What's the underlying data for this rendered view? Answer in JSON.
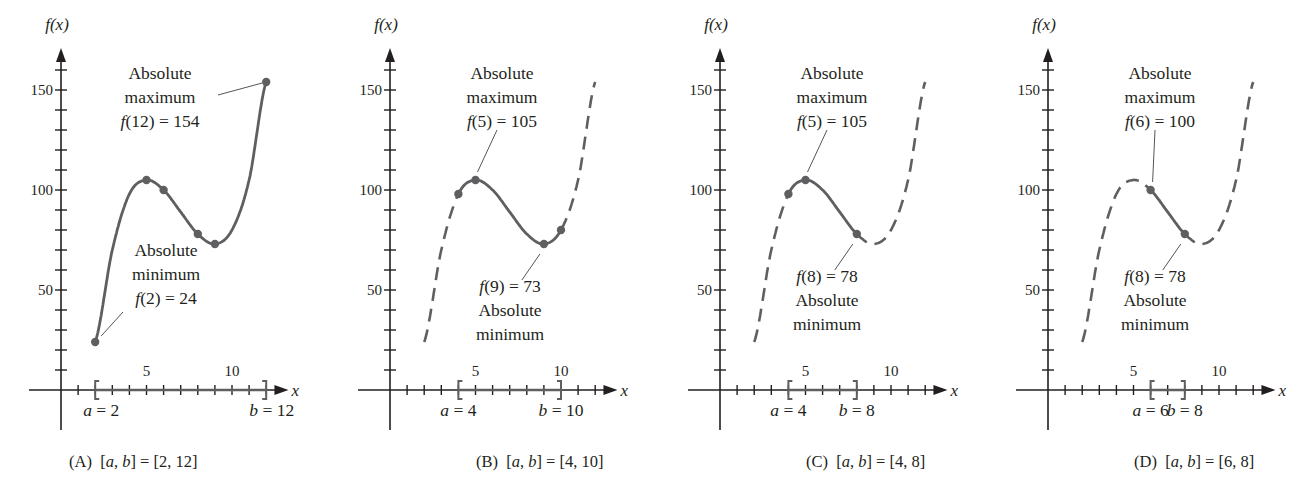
{
  "figure": {
    "colors": {
      "curve": "#5f5f61",
      "axis": "#231f20",
      "text": "#231f20",
      "background": "#ffffff"
    }
  },
  "chart_data": [
    {
      "id": "A",
      "type": "line",
      "caption": "(A)  [a, b] = [2, 12]",
      "ylabel": "f(x)",
      "xlabel": "x",
      "xlim": [
        -1,
        12.7
      ],
      "ylim": [
        -20,
        175
      ],
      "x_tick_labels": [
        {
          "x": 5,
          "label": "5"
        },
        {
          "x": 10,
          "label": "10"
        }
      ],
      "y_tick_labels": [
        {
          "y": 50,
          "label": "50"
        },
        {
          "y": 100,
          "label": "100"
        },
        {
          "y": 150,
          "label": "150"
        }
      ],
      "interval": {
        "a": 2,
        "b": 12,
        "a_label": "a = 2",
        "b_label": "b = 12"
      },
      "solid_range": [
        2,
        12
      ],
      "dashed_ranges": [],
      "points": [
        {
          "x": 2,
          "y": 24
        },
        {
          "x": 5,
          "y": 105
        },
        {
          "x": 6,
          "y": 100
        },
        {
          "x": 8,
          "y": 78
        },
        {
          "x": 9,
          "y": 73
        },
        {
          "x": 12,
          "y": 154
        }
      ],
      "annotations": [
        {
          "lines": [
            "Absolute",
            "maximum",
            "f(12) = 154"
          ],
          "kind": "absolute maximum",
          "x": 12,
          "y": 154
        },
        {
          "lines": [
            "Absolute",
            "minimum",
            "f(2) = 24"
          ],
          "kind": "absolute minimum",
          "x": 2,
          "y": 24
        }
      ]
    },
    {
      "id": "B",
      "type": "line",
      "caption": "(B)  [a, b] = [4, 10]",
      "ylabel": "f(x)",
      "xlabel": "x",
      "xlim": [
        -1,
        12.7
      ],
      "ylim": [
        -20,
        175
      ],
      "x_tick_labels": [
        {
          "x": 5,
          "label": "5"
        },
        {
          "x": 10,
          "label": "10"
        }
      ],
      "y_tick_labels": [
        {
          "y": 50,
          "label": "50"
        },
        {
          "y": 100,
          "label": "100"
        },
        {
          "y": 150,
          "label": "150"
        }
      ],
      "interval": {
        "a": 4,
        "b": 10,
        "a_label": "a = 4",
        "b_label": "b = 10"
      },
      "solid_range": [
        4,
        10
      ],
      "dashed_ranges": [
        [
          2,
          4
        ],
        [
          10,
          12
        ]
      ],
      "points": [
        {
          "x": 4,
          "y": 98
        },
        {
          "x": 5,
          "y": 105
        },
        {
          "x": 9,
          "y": 73
        },
        {
          "x": 10,
          "y": 80
        }
      ],
      "annotations": [
        {
          "lines": [
            "Absolute",
            "maximum",
            "f(5) = 105"
          ],
          "kind": "absolute maximum",
          "x": 5,
          "y": 105
        },
        {
          "lines": [
            "f(9) = 73",
            "Absolute",
            "minimum"
          ],
          "kind": "absolute minimum",
          "x": 9,
          "y": 73
        }
      ]
    },
    {
      "id": "C",
      "type": "line",
      "caption": "(C)  [a, b] = [4, 8]",
      "ylabel": "f(x)",
      "xlabel": "x",
      "xlim": [
        -1,
        12.7
      ],
      "ylim": [
        -20,
        175
      ],
      "x_tick_labels": [
        {
          "x": 5,
          "label": "5"
        },
        {
          "x": 10,
          "label": "10"
        }
      ],
      "y_tick_labels": [
        {
          "y": 50,
          "label": "50"
        },
        {
          "y": 100,
          "label": "100"
        },
        {
          "y": 150,
          "label": "150"
        }
      ],
      "interval": {
        "a": 4,
        "b": 8,
        "a_label": "a = 4",
        "b_label": "b = 8"
      },
      "solid_range": [
        4,
        8
      ],
      "dashed_ranges": [
        [
          2,
          4
        ],
        [
          8,
          12
        ]
      ],
      "points": [
        {
          "x": 4,
          "y": 98
        },
        {
          "x": 5,
          "y": 105
        },
        {
          "x": 8,
          "y": 78
        }
      ],
      "annotations": [
        {
          "lines": [
            "Absolute",
            "maximum",
            "f(5) = 105"
          ],
          "kind": "absolute maximum",
          "x": 5,
          "y": 105
        },
        {
          "lines": [
            "f(8) = 78",
            "Absolute",
            "minimum"
          ],
          "kind": "absolute minimum",
          "x": 8,
          "y": 78
        }
      ]
    },
    {
      "id": "D",
      "type": "line",
      "caption": "(D)  [a, b] = [6, 8]",
      "ylabel": "f(x)",
      "xlabel": "x",
      "xlim": [
        -1,
        12.7
      ],
      "ylim": [
        -20,
        175
      ],
      "x_tick_labels": [
        {
          "x": 5,
          "label": "5"
        },
        {
          "x": 10,
          "label": "10"
        }
      ],
      "y_tick_labels": [
        {
          "y": 50,
          "label": "50"
        },
        {
          "y": 100,
          "label": "100"
        },
        {
          "y": 150,
          "label": "150"
        }
      ],
      "interval": {
        "a": 6,
        "b": 8,
        "a_label": "a = 6",
        "b_label": "b = 8"
      },
      "solid_range": [
        6,
        8
      ],
      "dashed_ranges": [
        [
          2,
          6
        ],
        [
          8,
          12
        ]
      ],
      "points": [
        {
          "x": 6,
          "y": 100
        },
        {
          "x": 8,
          "y": 78
        }
      ],
      "annotations": [
        {
          "lines": [
            "Absolute",
            "maximum",
            "f(6) = 100"
          ],
          "kind": "absolute maximum",
          "x": 6,
          "y": 100
        },
        {
          "lines": [
            "f(8) = 78",
            "Absolute",
            "minimum"
          ],
          "kind": "absolute minimum",
          "x": 8,
          "y": 78
        }
      ]
    }
  ],
  "curve_samples": {
    "x": [
      2,
      3,
      4,
      5,
      6,
      7,
      8,
      9,
      10,
      11,
      12
    ],
    "y": [
      24,
      70,
      98,
      105,
      100,
      89,
      78,
      73,
      80,
      105,
      154
    ]
  }
}
